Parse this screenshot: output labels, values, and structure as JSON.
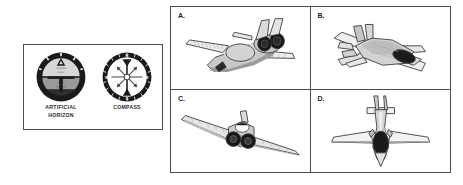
{
  "figure": {
    "background_color": "#ffffff",
    "border_color": "#4d4d4d"
  },
  "instrument_panel": {
    "instruments": [
      {
        "id": "artificial-horizon",
        "label": "ARTIFICIAL\nHORIZON",
        "icon": "artificial-horizon-icon",
        "bezel_color": "#1a1a1a",
        "sky_color": "#d7d7d7",
        "ground_color": "#9a9a9a",
        "lower_ground_color": "#2e2e2e",
        "symbol_color": "#1a1a1a"
      },
      {
        "id": "compass",
        "label": "COMPASS",
        "icon": "compass-icon",
        "bezel_color": "#1a1a1a",
        "dial_color": "#ffffff",
        "rose_color": "#3a3a3a",
        "needle_color": "#1a1a1a",
        "cardinal_points": [
          "N",
          "E",
          "S",
          "W"
        ]
      }
    ]
  },
  "aircraft_grid": {
    "cells": [
      {
        "label": "A.",
        "icon": "jet-aircraft-rear-three-quarter-icon",
        "description": "Twin-engine jet viewed from rear three-quarter, twin tail fins, two dark engine nozzles",
        "body_color": "#c9c9c9",
        "wing_color": "#e8e8e8",
        "shadow_color": "#9b9b9b",
        "nozzle_color": "#171717",
        "outline_color": "#3a3a3a"
      },
      {
        "label": "B.",
        "icon": "stealth-fighter-top-rear-icon",
        "description": "Stealth fighter viewed from above and behind, dark canopy, twin canted tails",
        "body_color": "#d2d2d2",
        "wing_color": "#f0f0f0",
        "shadow_color": "#a5a5a5",
        "canopy_color": "#1b1b1b",
        "outline_color": "#3a3a3a"
      },
      {
        "label": "C.",
        "icon": "jet-aircraft-rear-view-icon",
        "description": "Swept wing jet viewed nearly from directly behind with two dark engine nozzles",
        "body_color": "#cccccc",
        "wing_color": "#e6e6e6",
        "shadow_color": "#9d9d9d",
        "nozzle_color": "#171717",
        "outline_color": "#3a3a3a"
      },
      {
        "label": "D.",
        "icon": "jet-aircraft-top-view-icon",
        "description": "Symmetric top view of a jet with twin vertical tails and dark canopy",
        "body_color": "#d5d5d5",
        "wing_color": "#f2f2f2",
        "shadow_color": "#a8a8a8",
        "canopy_color": "#1b1b1b",
        "outline_color": "#3a3a3a"
      }
    ]
  }
}
